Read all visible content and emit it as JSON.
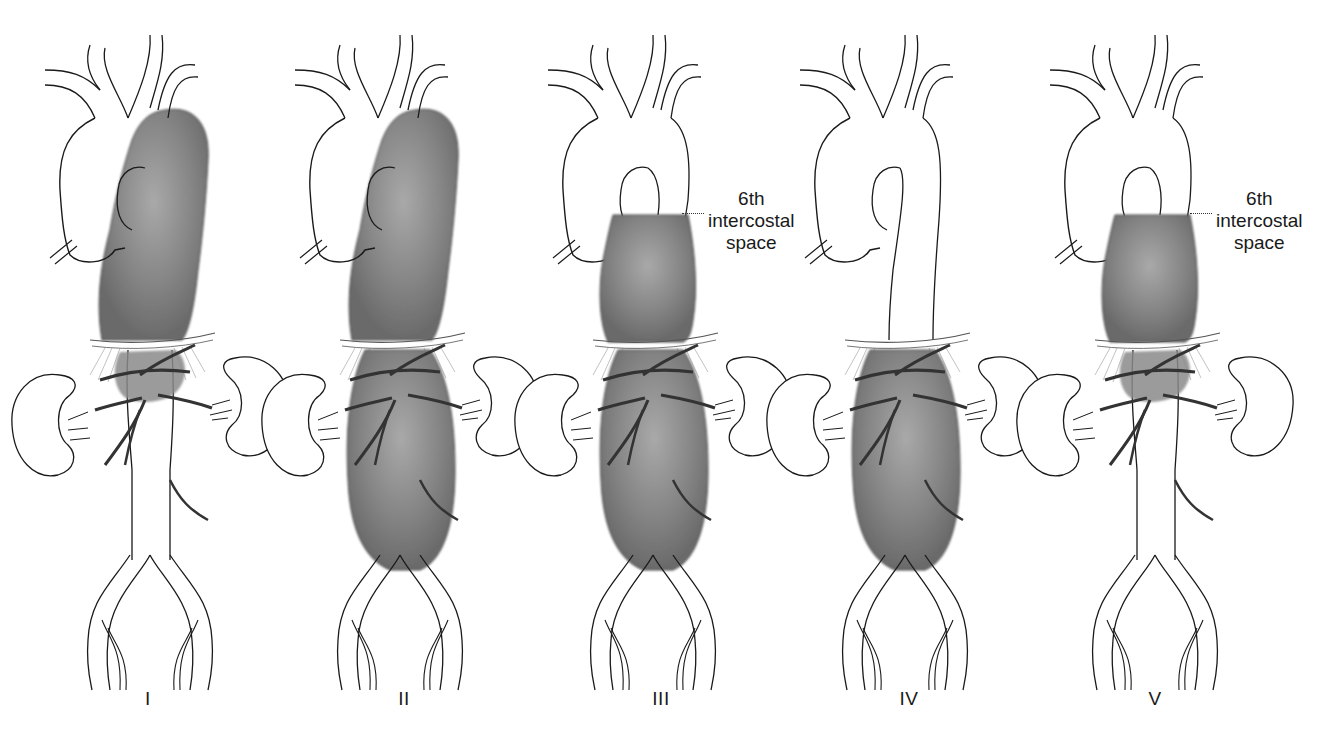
{
  "figure": {
    "panels": [
      {
        "id": "I",
        "label": "I",
        "cx": 150,
        "aneurysm": "thoracic",
        "thoracic_start": "proximal",
        "abdominal_end": "above-renal"
      },
      {
        "id": "II",
        "label": "II",
        "cx": 400,
        "aneurysm": "full",
        "thoracic_start": "proximal",
        "abdominal_end": "bifurcation"
      },
      {
        "id": "III",
        "label": "III",
        "cx": 653,
        "aneurysm": "full",
        "thoracic_start": "6th-intercostal",
        "abdominal_end": "bifurcation"
      },
      {
        "id": "IV",
        "label": "IV",
        "cx": 905,
        "aneurysm": "abdominal",
        "thoracic_start": "diaphragm",
        "abdominal_end": "bifurcation"
      },
      {
        "id": "V",
        "label": "V",
        "cx": 1155,
        "aneurysm": "thoracic-lower",
        "thoracic_start": "6th-intercostal",
        "abdominal_end": "above-renal"
      }
    ],
    "annotations": [
      {
        "panel": "III",
        "lines": [
          "6th",
          "intercostal",
          "space"
        ],
        "x": 735,
        "y": 185
      },
      {
        "panel": "V",
        "lines": [
          "6th",
          "intercostal",
          "space"
        ],
        "x": 1245,
        "y": 185
      }
    ],
    "colors": {
      "outline": "#1a1a1a",
      "aneurysm": "#7a7a7a",
      "aneurysm_highlight": "#a8a8a8",
      "background": "#ffffff"
    }
  }
}
